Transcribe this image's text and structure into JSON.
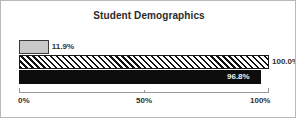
{
  "chart_data": {
    "type": "bar",
    "orientation": "horizontal",
    "title": "Student Demographics",
    "xlabel": "",
    "ylabel": "",
    "xlim": [
      0,
      100
    ],
    "grid": false,
    "legend": "none",
    "tick_labels": [
      "0%",
      "50%",
      "100%"
    ],
    "tick_values": [
      0,
      50,
      100
    ],
    "categories": [
      "",
      "",
      ""
    ],
    "series": [
      {
        "name": "bar-1",
        "value": 11.9,
        "label": "11.9%",
        "style": "solid-light-gray",
        "label_position": "outside-right"
      },
      {
        "name": "bar-2",
        "value": 100.0,
        "label": "100.0%",
        "style": "diagonal-hatch",
        "label_position": "outside-right"
      },
      {
        "name": "bar-3",
        "value": 96.8,
        "label": "96.8%",
        "style": "solid-black",
        "label_position": "inside-right"
      }
    ],
    "values": [
      11.9,
      100.0,
      96.8
    ],
    "colors": {
      "bar_gray": "#c9c9c9",
      "bar_black": "#0d0d0d",
      "hatch_stroke": "#111111",
      "axis": "#9a9a9a",
      "text": "#2f2f2f",
      "title": "#2a2a2a",
      "border": "#b9b9b9",
      "background": "#ffffff"
    }
  }
}
